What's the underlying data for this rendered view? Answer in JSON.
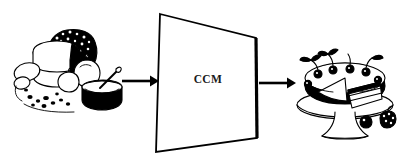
{
  "figure": {
    "background_color": "#ffffff",
    "ink_color": "#000000",
    "width": 403,
    "height": 163
  },
  "flow": {
    "input": {
      "name": "baking-ingredients-illustration",
      "description": "Black and white line drawing of baking ingredients: a block of butter, a dark textured loaf, eggs, apples, a pot with a spoon, and scattered crumbs",
      "alt": "raw ingredients"
    },
    "process": {
      "name": "ccm-plane",
      "label": "CCM",
      "shape": "trapezoid",
      "description": "Trapezoidal plane drawn in perspective, outlined in black with white fill"
    },
    "output": {
      "name": "decorated-cake-illustration",
      "description": "Black and white line drawing of a decorated layer cake on a pedestal stand with a slice cut out, cherries and leaves on top, berries beside the base",
      "alt": "finished cake"
    },
    "arrows": [
      {
        "name": "input-arrow",
        "direction": "right",
        "from": "baking-ingredients-illustration",
        "to": "ccm-plane"
      },
      {
        "name": "output-arrow",
        "direction": "right",
        "from": "ccm-plane",
        "to": "decorated-cake-illustration"
      }
    ]
  }
}
